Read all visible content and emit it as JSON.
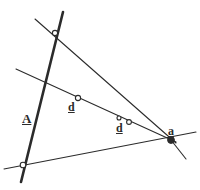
{
  "figure": {
    "kind": "geometry-diagram",
    "background_color": "#ffffff",
    "ink_color": "#2b2b2b",
    "width": 200,
    "height": 190
  },
  "labels": [
    {
      "id": "label-A",
      "text": "A",
      "x": 22,
      "y": 112,
      "size": 13,
      "weight": "bold",
      "underlined": true,
      "role": "line-label",
      "describes": "thick-steep-line"
    },
    {
      "id": "label-d1",
      "text": "d",
      "x": 68,
      "y": 101,
      "size": 12,
      "weight": "bold",
      "underlined": true,
      "role": "point-label",
      "describes": "point-d1"
    },
    {
      "id": "label-d2",
      "text": "d",
      "x": 116,
      "y": 122,
      "size": 12,
      "weight": "bold",
      "underlined": true,
      "role": "point-label",
      "describes": "point-d2"
    },
    {
      "id": "label-a",
      "text": "a",
      "x": 168,
      "y": 125,
      "size": 12,
      "weight": "bold",
      "underlined": true,
      "role": "point-label",
      "describes": "point-a-convergence"
    }
  ],
  "lines": [
    {
      "id": "line-A",
      "name": "thick-steep-line",
      "x1": 63,
      "y1": 12,
      "x2": 21,
      "y2": 182,
      "stroke_width": 2.6,
      "color": "#2b2b2b"
    },
    {
      "id": "line-upper",
      "name": "upper-transversal",
      "x1": 35,
      "y1": 19,
      "x2": 176,
      "y2": 143,
      "stroke_width": 1.1,
      "color": "#2b2b2b"
    },
    {
      "id": "line-mid",
      "name": "mid-transversal-through-d-points",
      "x1": 16,
      "y1": 69,
      "x2": 176,
      "y2": 142,
      "stroke_width": 1.1,
      "color": "#2b2b2b"
    },
    {
      "id": "line-lower",
      "name": "lower-transversal",
      "x1": 4,
      "y1": 169,
      "x2": 196,
      "y2": 132,
      "stroke_width": 1.1,
      "color": "#2b2b2b"
    },
    {
      "id": "line-ray",
      "name": "short-ray-from-a",
      "x1": 171,
      "y1": 140,
      "x2": 186,
      "y2": 159,
      "stroke_width": 1.1,
      "color": "#2b2b2b"
    }
  ],
  "points": [
    {
      "id": "pt-top",
      "name": "top-intersection",
      "x": 55,
      "y": 33,
      "r": 2.6,
      "filled": false
    },
    {
      "id": "pt-d1",
      "name": "point-d1",
      "x": 78,
      "y": 98,
      "r": 2.6,
      "filled": false
    },
    {
      "id": "pt-d2a",
      "name": "point-d2-inner",
      "x": 119,
      "y": 118,
      "r": 2.0,
      "filled": false
    },
    {
      "id": "pt-d2b",
      "name": "point-d2-outer",
      "x": 129,
      "y": 122,
      "r": 2.4,
      "filled": false
    },
    {
      "id": "pt-bl",
      "name": "bottom-left-intersection",
      "x": 23,
      "y": 165,
      "r": 2.8,
      "filled": false
    },
    {
      "id": "pt-a",
      "name": "point-a-convergence",
      "x": 171,
      "y": 140,
      "r": 3.4,
      "filled": true
    }
  ]
}
